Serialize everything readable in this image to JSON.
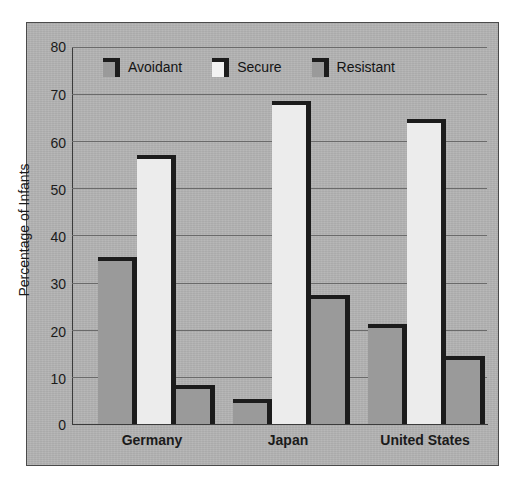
{
  "chart_data": {
    "type": "bar",
    "title": "",
    "xlabel": "",
    "ylabel": "Percentage of Infants",
    "ylim": [
      0,
      80
    ],
    "ytick_labels": [
      "80",
      "70",
      "60",
      "50",
      "40",
      "30",
      "20",
      "10",
      "0"
    ],
    "ytick_values": [
      80,
      70,
      60,
      50,
      40,
      30,
      20,
      10,
      0
    ],
    "grid": "horizontal",
    "legend_position": "top-left-inside",
    "categories": [
      "Germany",
      "Japan",
      "United States"
    ],
    "series": [
      {
        "name": "Avoidant",
        "color": "#9a9a9a",
        "values": [
          35.5,
          5.3,
          21.3
        ]
      },
      {
        "name": "Secure",
        "color": "#ececec",
        "values": [
          57.0,
          68.5,
          64.8
        ]
      },
      {
        "name": "Resistant",
        "color": "#9a9a9a",
        "values": [
          8.2,
          27.3,
          14.5
        ]
      }
    ]
  },
  "legend": {
    "items": [
      {
        "label": "Avoidant",
        "swatch": "gray",
        "icon": "legend-swatch-icon"
      },
      {
        "label": "Secure",
        "swatch": "white",
        "icon": "legend-swatch-icon"
      },
      {
        "label": "Resistant",
        "swatch": "gray",
        "icon": "legend-swatch-icon"
      }
    ]
  },
  "colors": {
    "panel_background": "#b3b3b3",
    "page_background": "#ffffff",
    "bar_gray": "#9a9a9a",
    "bar_white": "#ececec",
    "bar_shadow": "#1c1c1c",
    "gridline": "#6a6a6a",
    "axis": "#3b3b3b",
    "text": "#1b1b1b"
  }
}
